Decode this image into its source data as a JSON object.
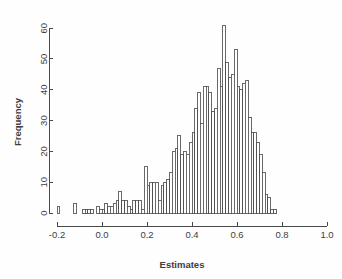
{
  "chart_data": {
    "type": "bar",
    "title": "",
    "subtitle": "",
    "xlabel": "Estimates",
    "ylabel": "Frequency",
    "grid": false,
    "legend": "none",
    "xlim": [
      -0.2,
      1.0
    ],
    "ylim": [
      0,
      62
    ],
    "xticks": [
      -0.2,
      0.0,
      0.2,
      0.4,
      0.6,
      0.8,
      1.0
    ],
    "xtick_labels": [
      "-0.2",
      "0.0",
      "0.2",
      "0.4",
      "0.6",
      "0.8",
      "1.0"
    ],
    "yticks": [
      0,
      10,
      20,
      30,
      40,
      50,
      60
    ],
    "ytick_labels": [
      "0",
      "10",
      "20",
      "30",
      "40",
      "50",
      "60"
    ],
    "bin_width": 0.0125,
    "bin_starts": [
      -0.2,
      -0.1875,
      -0.175,
      -0.1625,
      -0.15,
      -0.1375,
      -0.125,
      -0.1125,
      -0.1,
      -0.0875,
      -0.075,
      -0.0625,
      -0.05,
      -0.0375,
      -0.025,
      -0.0125,
      0.0,
      0.0125,
      0.025,
      0.0375,
      0.05,
      0.0625,
      0.075,
      0.0875,
      0.1,
      0.1125,
      0.125,
      0.1375,
      0.15,
      0.1625,
      0.175,
      0.1875,
      0.2,
      0.2125,
      0.225,
      0.2375,
      0.25,
      0.2625,
      0.275,
      0.2875,
      0.3,
      0.3125,
      0.325,
      0.3375,
      0.35,
      0.3625,
      0.375,
      0.3875,
      0.4,
      0.4125,
      0.425,
      0.4375,
      0.45,
      0.4625,
      0.475,
      0.4875,
      0.5,
      0.5125,
      0.525,
      0.5375,
      0.55,
      0.5625,
      0.575,
      0.5875,
      0.6,
      0.6125,
      0.625,
      0.6375,
      0.65,
      0.6625,
      0.675,
      0.6875,
      0.7,
      0.7125,
      0.725,
      0.7375,
      0.75,
      0.7625,
      0.775,
      0.7875,
      0.8,
      0.8125,
      0.825,
      0.8375,
      0.85,
      0.8625,
      0.875,
      0.8875,
      0.9,
      0.9125,
      0.925,
      0.9375
    ],
    "values": [
      2,
      0,
      0,
      0,
      0,
      0,
      3,
      0,
      0,
      1,
      1,
      1,
      1,
      0,
      2,
      1,
      1,
      3,
      2,
      2,
      3,
      4,
      7,
      4,
      4,
      2,
      1,
      4,
      4,
      4,
      1,
      15,
      9,
      10,
      10,
      10,
      4,
      9,
      10,
      11,
      13,
      20,
      21,
      25,
      19,
      20,
      19,
      23,
      26,
      34,
      39,
      29,
      41,
      41,
      39,
      33,
      34,
      47,
      41,
      61,
      49,
      44,
      45,
      53,
      41,
      40,
      42,
      43,
      31,
      26,
      26,
      23,
      19,
      13,
      6,
      5,
      1,
      1
    ],
    "xtick_positions": [
      -0.2,
      0.0,
      0.2,
      0.4,
      0.6,
      0.8,
      1.0
    ],
    "max_value": 61,
    "n_bins": 78,
    "bar_fill": "#ffffff",
    "bar_stroke": "#4f4f4f",
    "axis_color": "#4a4a4a",
    "background": "#fefefe"
  },
  "plot": {
    "left_px": 57,
    "right_px": 327,
    "bottom_px": 213,
    "top_px": 22
  }
}
